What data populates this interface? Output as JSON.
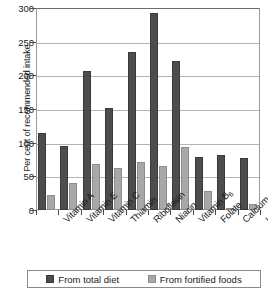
{
  "chart_data": {
    "type": "bar",
    "title": "",
    "xlabel": "",
    "ylabel": "Per cent of recommended intake",
    "ylim": [
      0,
      300
    ],
    "yticks": [
      0,
      50,
      100,
      150,
      200,
      250,
      300
    ],
    "ytick_labels": [
      "0",
      "50",
      "100",
      "150",
      "200",
      "250",
      "300"
    ],
    "grid": true,
    "legend_position": "bottom",
    "categories": [
      "Vitamin A",
      "Vitamin E",
      "Vitamin C",
      "Thiamin",
      "Riboflavin",
      "Niacin",
      "Vitamin B6",
      "Folate",
      "Calcium",
      "Iron"
    ],
    "category_labels_html": [
      "Vitamin A",
      "Vitamin E",
      "Vitamin C",
      "Thiamin",
      "Riboflavin",
      "Niacin",
      "Vitamin B<sub>6</sub>",
      "Folate",
      "Calcium",
      "Iron"
    ],
    "series": [
      {
        "name": "From total diet",
        "color": "#4d4d4d",
        "values": [
          115,
          95,
          207,
          152,
          235,
          293,
          221,
          78,
          82,
          77
        ]
      },
      {
        "name": "From fortified foods",
        "color": "#a8a8a8",
        "values": [
          22,
          40,
          68,
          62,
          72,
          65,
          94,
          28,
          3,
          9
        ]
      }
    ]
  },
  "legend": {
    "items": [
      {
        "label": "From total diet",
        "swatch": "dark-square-swatch"
      },
      {
        "label": "From fortified foods",
        "swatch": "light-square-swatch"
      }
    ]
  }
}
